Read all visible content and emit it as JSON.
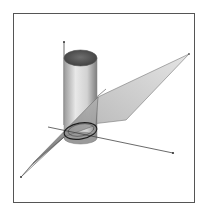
{
  "figure": {
    "objects": [
      "cylinder",
      "cutting-plane",
      "intersection-ellipse",
      "x-axis",
      "y-axis",
      "z-axis"
    ]
  },
  "colors": {
    "frame": "#555555",
    "background": "#ffffff",
    "cylinder_top": "#5a5a5a",
    "cylinder_body_light": "#e6e6e6",
    "cylinder_body_dark": "#8a8a8a",
    "plane_light": "#d6d6d6",
    "plane_dark": "#8c8c8c",
    "ellipse": "#222222",
    "axis": "#444444"
  }
}
